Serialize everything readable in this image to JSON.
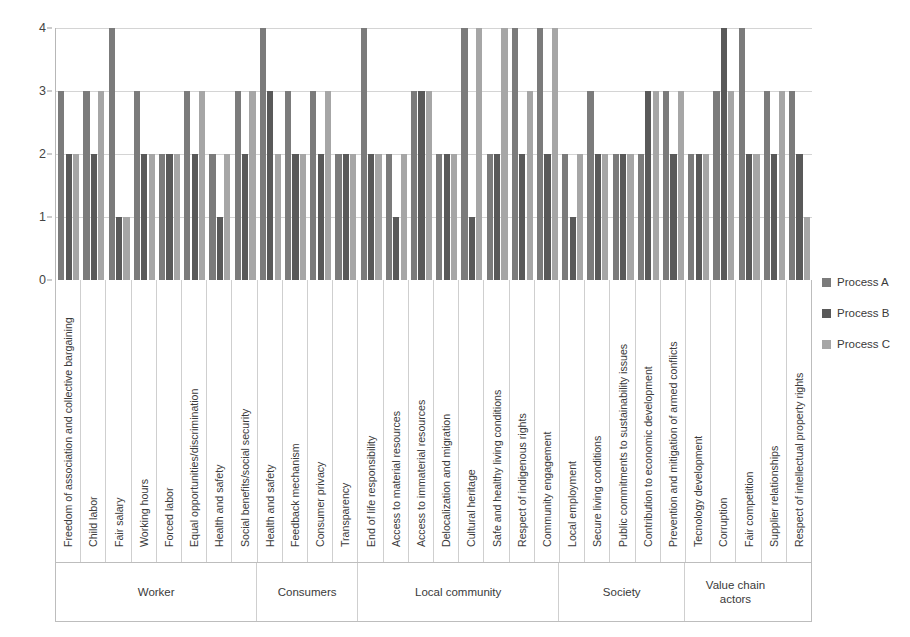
{
  "legend": {
    "position": "right",
    "items": [
      {
        "label": "Process A",
        "color": "#7b7b7b"
      },
      {
        "label": "Process B",
        "color": "#595959"
      },
      {
        "label": "Process C",
        "color": "#a6a6a6"
      }
    ]
  },
  "axis": {
    "y_ticks": [
      "0",
      "1",
      "2",
      "3",
      "4"
    ],
    "y_min": 0,
    "y_max": 4
  },
  "sections": [
    {
      "label": "Worker",
      "span": 8
    },
    {
      "label": "Consumers",
      "span": 4
    },
    {
      "label": "Local community",
      "span": 8
    },
    {
      "label": "Society",
      "span": 5
    },
    {
      "label": "Value chain actors",
      "span": 4
    }
  ],
  "chart_data": {
    "type": "bar",
    "title": "",
    "xlabel": "",
    "ylabel": "",
    "ylim": [
      0,
      4
    ],
    "grid": true,
    "categories": [
      "Freedom of association and collective bargaining",
      "Child labor",
      "Fair salary",
      "Working hours",
      "Forced labor",
      "Equal opportunities/discrimination",
      "Health and safety",
      "Social benefits/social security",
      "Health and safety",
      "Feedback mechanism",
      "Consumer privacy",
      "Transparency",
      "End of life responsibility",
      "Access to material resources",
      "Access to immaterial resources",
      "Delocalization and migration",
      "Cultural heritage",
      "Safe and healthy living conditions",
      "Respect of indigenous rights",
      "Community engagement",
      "Local employment",
      "Secure living conditions",
      "Public commitments to sustainability issues",
      "Contribution to economic development",
      "Prevention and mitigation of armed conflicts",
      "Tecnology development",
      "Corruption",
      "Fair competition",
      "Supplier relationships",
      "Respect of intellectual property rights"
    ],
    "series": [
      {
        "name": "Process A",
        "color": "#7b7b7b",
        "values": [
          3,
          3,
          4,
          3,
          2,
          3,
          2,
          3,
          4,
          3,
          3,
          2,
          4,
          2,
          3,
          2,
          4,
          2,
          4,
          4,
          2,
          3,
          2,
          2,
          3,
          2,
          3,
          4,
          3,
          3
        ]
      },
      {
        "name": "Process B",
        "color": "#595959",
        "values": [
          2,
          2,
          1,
          2,
          2,
          2,
          1,
          2,
          3,
          2,
          2,
          2,
          2,
          1,
          3,
          2,
          1,
          2,
          2,
          2,
          1,
          2,
          2,
          3,
          2,
          2,
          4,
          2,
          2,
          2
        ]
      },
      {
        "name": "Process C",
        "color": "#a6a6a6",
        "values": [
          2,
          3,
          1,
          2,
          2,
          3,
          2,
          3,
          2,
          2,
          3,
          2,
          2,
          2,
          3,
          2,
          4,
          4,
          3,
          4,
          2,
          2,
          2,
          3,
          3,
          2,
          3,
          2,
          3,
          1
        ]
      }
    ]
  }
}
